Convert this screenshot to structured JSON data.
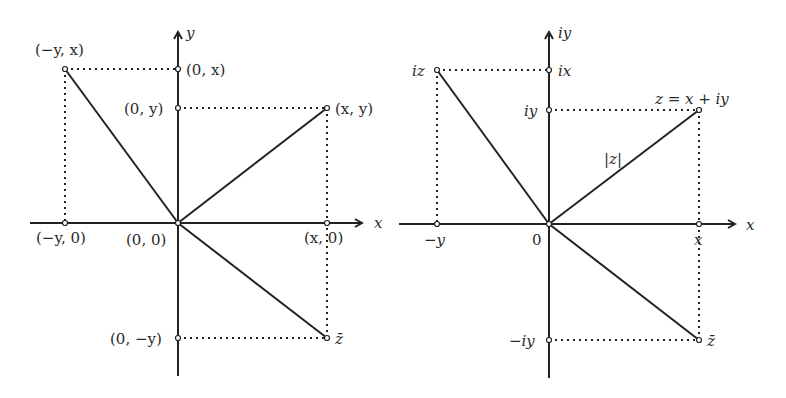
{
  "left_diagram": {
    "axis_x_label": "x",
    "axis_y_label": "y",
    "points": {
      "origin": "(0, 0)",
      "xy": "(x, y)",
      "neg_y_x": "(−y, x)",
      "zero_x": "(0, x)",
      "zero_y": "(0, y)",
      "neg_y_zero": "(−y, 0)",
      "x_zero": "(x, 0)",
      "zero_neg_y": "(0, −y)",
      "conj": "z̄"
    }
  },
  "right_diagram": {
    "axis_x_label": "x",
    "axis_y_label": "iy",
    "points": {
      "origin": "0",
      "z": "z = x + iy",
      "iz": "iz",
      "ix": "ix",
      "iy": "iy",
      "neg_y": "−y",
      "x": "x",
      "neg_iy": "−iy",
      "conj": "z̄",
      "modulus": "|z|"
    }
  }
}
